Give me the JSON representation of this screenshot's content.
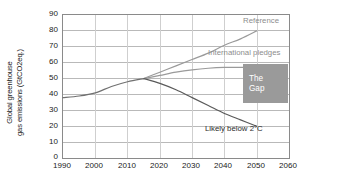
{
  "chart_data": {
    "type": "line",
    "title": "",
    "xlabel": "",
    "ylabel": "Global greenhouse gas emissions (GtCO2eq.)",
    "ylabel_line1": "Global greenhouse",
    "ylabel_line2": "gas emissions (GtCO2eq.)",
    "xlim": [
      1990,
      2060
    ],
    "ylim": [
      0,
      90
    ],
    "xticks": [
      1990,
      2000,
      2010,
      2020,
      2030,
      2040,
      2050,
      2060
    ],
    "yticks": [
      0,
      10,
      20,
      30,
      40,
      50,
      60,
      70,
      80,
      90
    ],
    "grid": true,
    "legend_position": "inline-annotations",
    "series": [
      {
        "name": "Historical",
        "color": "#707070",
        "x": [
          1990,
          1995,
          2000,
          2005,
          2010,
          2015
        ],
        "values": [
          38,
          39,
          41,
          45,
          48,
          50
        ]
      },
      {
        "name": "Reference",
        "color": "#9a9a9a",
        "x": [
          2015,
          2020,
          2025,
          2030,
          2035,
          2040,
          2045,
          2050
        ],
        "values": [
          50,
          54,
          58,
          62,
          66,
          71,
          75,
          80
        ]
      },
      {
        "name": "International pledges",
        "color": "#9a9a9a",
        "x": [
          2015,
          2020,
          2025,
          2030,
          2035,
          2040,
          2045,
          2050
        ],
        "values": [
          50,
          52,
          54,
          55.5,
          56.5,
          57,
          57,
          57
        ]
      },
      {
        "name": "Likely below 2°C",
        "color": "#5a5a5a",
        "x": [
          2015,
          2020,
          2025,
          2030,
          2035,
          2040,
          2045,
          2050
        ],
        "values": [
          50,
          47,
          43,
          38,
          33,
          28,
          24,
          20
        ]
      }
    ],
    "annotations": [
      {
        "name": "reference-label",
        "text": "Reference",
        "color": "#8d8d8d"
      },
      {
        "name": "pledges-label",
        "text": "International pledges",
        "color": "#8d8d8d"
      },
      {
        "name": "gap-label-line1",
        "text": "The",
        "color": "#ffffff"
      },
      {
        "name": "gap-label-line2",
        "text": "Gap",
        "color": "#ffffff"
      },
      {
        "name": "below-2c-label",
        "text": "Likely below 2°C",
        "color": "#2b2b2b"
      }
    ],
    "gap_box_color": "#9a9a9a"
  },
  "labels": {
    "reference": "Reference",
    "pledges": "International pledges",
    "gap_line1": "The",
    "gap_line2": "Gap",
    "below_2c": "Likely below 2°C"
  }
}
